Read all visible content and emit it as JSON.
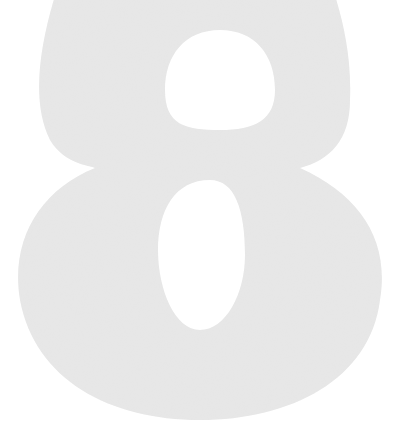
{
  "figure": {
    "character": "8",
    "fill_color": "#e6e6e6",
    "hole_color": "#ffffff",
    "background_color": "#ffffff"
  }
}
